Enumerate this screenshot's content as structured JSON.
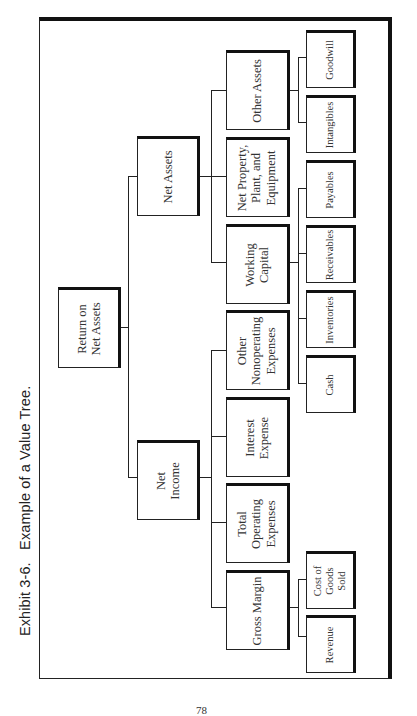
{
  "caption": "Exhibit 3-6.   Example of a Value Tree.",
  "page_number": "78",
  "tree": {
    "root": {
      "label": "Return on\nNet Assets"
    },
    "net_assets": {
      "label": "Net Assets",
      "children": {
        "other_assets": {
          "label": "Other Assets",
          "children": [
            "Goodwill",
            "Intangibles"
          ]
        },
        "ppe": {
          "label": "Net Property,\nPlant, and\nEquipment"
        },
        "working_capital": {
          "label": "Working\nCapital",
          "children": [
            "Payables",
            "Receivables",
            "Inventories",
            "Cash"
          ]
        }
      }
    },
    "net_income": {
      "label": "Net\nIncome",
      "children": {
        "other_nonoperating": {
          "label": "Other\nNonoperating\nExpenses"
        },
        "interest_expense": {
          "label": "Interest\nExpense"
        },
        "total_operating": {
          "label": "Total\nOperating\nExpenses"
        },
        "gross_margin": {
          "label": "Gross Margin",
          "children": [
            "Cost of\nGoods\nSold",
            "Revenue"
          ]
        }
      }
    }
  },
  "colors": {
    "line": "#222222",
    "text": "#333333",
    "background": "#ffffff"
  }
}
